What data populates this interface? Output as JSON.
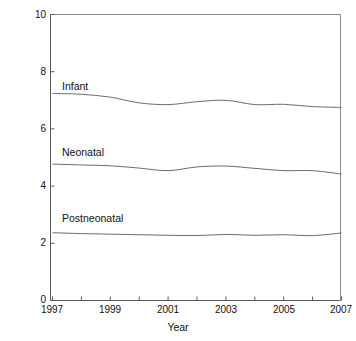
{
  "figure": {
    "background_color": "#ffffff",
    "axis_color": "#5a5a5a",
    "line_color": "#6b6b6b"
  },
  "axes": {
    "y_title": "Deaths per 1000 live births",
    "x_title": "Year",
    "y_ticks": [
      "0",
      "2",
      "4",
      "6",
      "8",
      "10"
    ],
    "x_ticks": [
      "1997",
      "1999",
      "2001",
      "2003",
      "2005",
      "2007"
    ]
  },
  "series_labels": {
    "infant": "Infant",
    "neonatal": "Neonatal",
    "postneonatal": "Postneonatal"
  },
  "caption": "",
  "chart_data": {
    "type": "line",
    "title": "",
    "xlabel": "Year",
    "ylabel": "Deaths per 1000 live births",
    "xlim": [
      1997,
      2007
    ],
    "ylim": [
      0,
      10
    ],
    "y_ticks": [
      0,
      2,
      4,
      6,
      8,
      10
    ],
    "x_ticks_major": [
      1997,
      1999,
      2001,
      2003,
      2005,
      2007
    ],
    "x_ticks_minor": [
      1998,
      2000,
      2002,
      2004,
      2006
    ],
    "grid": false,
    "legend": "inline-labels-above-each-line",
    "x": [
      1997,
      1998,
      1999,
      2000,
      2001,
      2002,
      2003,
      2004,
      2005,
      2006,
      2007
    ],
    "series": [
      {
        "name": "Infant",
        "values": [
          7.24,
          7.21,
          7.11,
          6.91,
          6.85,
          6.95,
          7.0,
          6.85,
          6.86,
          6.78,
          6.75
        ]
      },
      {
        "name": "Neonatal",
        "values": [
          4.77,
          4.74,
          4.71,
          4.63,
          4.54,
          4.67,
          4.7,
          4.62,
          4.54,
          4.54,
          4.42
        ]
      },
      {
        "name": "Postneonatal",
        "values": [
          2.37,
          2.34,
          2.32,
          2.3,
          2.28,
          2.27,
          2.31,
          2.28,
          2.3,
          2.27,
          2.36
        ]
      }
    ]
  }
}
